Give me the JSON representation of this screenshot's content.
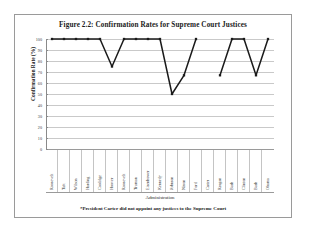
{
  "figure": {
    "title": "Figure 2.2: Confirmation Rates for Supreme Court Justices",
    "footnote": "*President Carter did not appoint any justices to the Supreme Court"
  },
  "chart_data": {
    "type": "line",
    "title": "Figure 2.2: Confirmation Rates for Supreme Court Justices",
    "xlabel": "Administration",
    "ylabel": "Confirmation Rate (%)",
    "ylim": [
      0,
      100
    ],
    "ytick_step": 10,
    "ytick_labels": [
      "0",
      "10",
      "20",
      "30",
      "40",
      "50",
      "60",
      "70",
      "80",
      "90",
      "100"
    ],
    "grid": true,
    "legend": "none",
    "marker": "filled-square",
    "line_color": "#1a1a1a",
    "categories": [
      "Roosevelt",
      "Taft",
      "Wilson",
      "Harding",
      "Coolidge",
      "Hoover",
      "Roosevelt",
      "Truman",
      "Eisenhower",
      "Kennedy",
      "Johnson",
      "Nixon",
      "Ford",
      "Carter",
      "Reagan",
      "Bush",
      "Clinton",
      "Bush",
      "Obama"
    ],
    "values": [
      100,
      100,
      100,
      100,
      100,
      75,
      100,
      100,
      100,
      100,
      50,
      67,
      100,
      null,
      67,
      100,
      100,
      67,
      100
    ],
    "annotations": [
      "Carter has no data point; President Carter did not appoint any justices to the Supreme Court"
    ]
  }
}
